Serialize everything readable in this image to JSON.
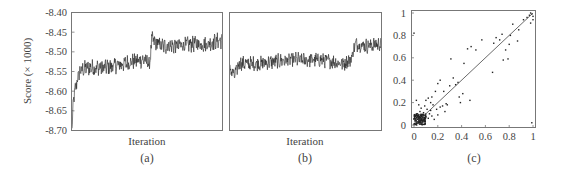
{
  "chart_data": [
    {
      "id": "a",
      "type": "line",
      "panel_label": "(a)",
      "xlabel": "Iteration",
      "ylabel": "Score (× 1000)",
      "ylim": [
        -8.7,
        -8.4
      ],
      "yticks": [
        "-8.40",
        "-8.45",
        "-8.50",
        "-8.55",
        "-8.60",
        "-8.65",
        "-8.70"
      ],
      "ytick_values": [
        -8.4,
        -8.45,
        -8.5,
        -8.55,
        -8.6,
        -8.65,
        -8.7
      ],
      "x_ticks_shown": false,
      "grid": false,
      "trend": [
        {
          "x": 0.0,
          "y": -8.7
        },
        {
          "x": 0.01,
          "y": -8.62
        },
        {
          "x": 0.03,
          "y": -8.58
        },
        {
          "x": 0.05,
          "y": -8.55
        },
        {
          "x": 0.1,
          "y": -8.54
        },
        {
          "x": 0.2,
          "y": -8.54
        },
        {
          "x": 0.3,
          "y": -8.535
        },
        {
          "x": 0.4,
          "y": -8.525
        },
        {
          "x": 0.48,
          "y": -8.52
        },
        {
          "x": 0.52,
          "y": -8.53
        },
        {
          "x": 0.53,
          "y": -8.47
        },
        {
          "x": 0.6,
          "y": -8.485
        },
        {
          "x": 0.7,
          "y": -8.485
        },
        {
          "x": 0.8,
          "y": -8.48
        },
        {
          "x": 0.9,
          "y": -8.48
        },
        {
          "x": 1.0,
          "y": -8.47
        }
      ],
      "noise_amplitude": 0.018
    },
    {
      "id": "b",
      "type": "line",
      "panel_label": "(b)",
      "xlabel": "Iteration",
      "ylabel": "",
      "ylim": [
        -8.7,
        -8.4
      ],
      "shares_y_with": "a",
      "x_ticks_shown": false,
      "grid": false,
      "trend": [
        {
          "x": 0.0,
          "y": -8.545
        },
        {
          "x": 0.03,
          "y": -8.56
        },
        {
          "x": 0.06,
          "y": -8.53
        },
        {
          "x": 0.2,
          "y": -8.53
        },
        {
          "x": 0.4,
          "y": -8.52
        },
        {
          "x": 0.6,
          "y": -8.52
        },
        {
          "x": 0.75,
          "y": -8.53
        },
        {
          "x": 0.8,
          "y": -8.52
        },
        {
          "x": 0.83,
          "y": -8.48
        },
        {
          "x": 0.9,
          "y": -8.485
        },
        {
          "x": 1.0,
          "y": -8.48
        }
      ],
      "noise_amplitude": 0.016
    },
    {
      "id": "c",
      "type": "scatter",
      "panel_label": "(c)",
      "xlabel": "",
      "ylabel": "",
      "xlim": [
        0,
        1
      ],
      "ylim": [
        0,
        1
      ],
      "xticks": [
        "0",
        "0.2",
        "0.4",
        "0.6",
        "0.8",
        "1"
      ],
      "xtick_values": [
        0,
        0.2,
        0.4,
        0.6,
        0.8,
        1
      ],
      "yticks": [
        "0",
        "0.2",
        "0.4",
        "0.6",
        "0.8",
        "1"
      ],
      "ytick_values": [
        0,
        0.2,
        0.4,
        0.6,
        0.8,
        1
      ],
      "reference_line": {
        "from": [
          0,
          0
        ],
        "to": [
          1,
          1
        ]
      },
      "grid": false,
      "points": [
        [
          0.0,
          0.82
        ],
        [
          0.31,
          0.59
        ],
        [
          0.42,
          0.55
        ],
        [
          0.45,
          0.68
        ],
        [
          0.48,
          0.7
        ],
        [
          0.52,
          0.67
        ],
        [
          0.57,
          0.76
        ],
        [
          0.66,
          0.47
        ],
        [
          0.67,
          0.73
        ],
        [
          0.69,
          0.78
        ],
        [
          0.72,
          0.76
        ],
        [
          0.74,
          0.81
        ],
        [
          0.75,
          0.58
        ],
        [
          0.77,
          0.67
        ],
        [
          0.79,
          0.59
        ],
        [
          0.8,
          0.72
        ],
        [
          0.81,
          0.8
        ],
        [
          0.83,
          0.9
        ],
        [
          0.87,
          0.75
        ],
        [
          0.88,
          0.85
        ],
        [
          0.92,
          0.94
        ],
        [
          0.95,
          0.96
        ],
        [
          0.97,
          0.98
        ],
        [
          0.98,
          1.0
        ],
        [
          0.99,
          0.99
        ],
        [
          1.0,
          0.97
        ],
        [
          1.0,
          0.94
        ],
        [
          0.99,
          0.02
        ],
        [
          0.98,
          0.91
        ],
        [
          0.38,
          0.25
        ],
        [
          0.39,
          0.2
        ],
        [
          0.41,
          0.28
        ],
        [
          0.47,
          0.22
        ],
        [
          0.35,
          0.36
        ],
        [
          0.37,
          0.38
        ],
        [
          0.3,
          0.35
        ],
        [
          0.33,
          0.42
        ],
        [
          0.22,
          0.4
        ],
        [
          0.2,
          0.37
        ],
        [
          0.25,
          0.3
        ],
        [
          0.27,
          0.19
        ],
        [
          0.24,
          0.17
        ],
        [
          0.22,
          0.16
        ],
        [
          0.26,
          0.12
        ],
        [
          0.28,
          0.18
        ],
        [
          0.18,
          0.3
        ],
        [
          0.15,
          0.25
        ],
        [
          0.12,
          0.24
        ],
        [
          0.1,
          0.22
        ],
        [
          0.14,
          0.2
        ],
        [
          0.16,
          0.18
        ],
        [
          0.19,
          0.14
        ],
        [
          0.13,
          0.1
        ],
        [
          0.02,
          0.22
        ],
        [
          0.04,
          0.18
        ],
        [
          0.06,
          0.15
        ],
        [
          0.09,
          0.17
        ],
        [
          0.11,
          0.14
        ],
        [
          0.08,
          0.11
        ],
        [
          0.05,
          0.12
        ],
        [
          0.03,
          0.1
        ],
        [
          0.01,
          0.08
        ],
        [
          0.07,
          0.09
        ],
        [
          0.1,
          0.07
        ],
        [
          0.12,
          0.06
        ],
        [
          0.15,
          0.08
        ],
        [
          0.17,
          0.05
        ],
        [
          0.2,
          0.09
        ],
        [
          0.14,
          0.13
        ],
        [
          0.06,
          0.05
        ],
        [
          0.04,
          0.04
        ]
      ],
      "dense_cluster": {
        "x_range": [
          0.0,
          0.1
        ],
        "y_range": [
          0.0,
          0.1
        ],
        "count": 140
      }
    }
  ]
}
